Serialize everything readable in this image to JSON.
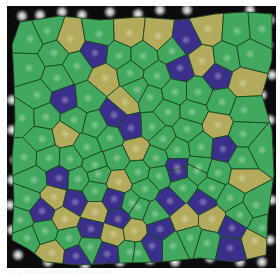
{
  "figure": {
    "type": "microscopy-voronoi-overlay",
    "frame": {
      "x": 7,
      "y": 6,
      "width": 269,
      "height": 262
    },
    "background_color": "#0c0a0c",
    "border_color": "#1c4a22",
    "colors": {
      "G": "#43a85f",
      "Y": "#b3ab5b",
      "B": "#3b2f8c"
    },
    "cells": [
      {
        "x": 30,
        "y": 39,
        "c": "G"
      },
      {
        "x": 47,
        "y": 31,
        "c": "G"
      },
      {
        "x": 70,
        "y": 39,
        "c": "Y"
      },
      {
        "x": 99,
        "y": 34,
        "c": "G"
      },
      {
        "x": 129,
        "y": 33,
        "c": "Y"
      },
      {
        "x": 95,
        "y": 53,
        "c": "B"
      },
      {
        "x": 119,
        "y": 56,
        "c": "G"
      },
      {
        "x": 29,
        "y": 68,
        "c": "G"
      },
      {
        "x": 54,
        "y": 53,
        "c": "G"
      },
      {
        "x": 57,
        "y": 78,
        "c": "G"
      },
      {
        "x": 77,
        "y": 66,
        "c": "G"
      },
      {
        "x": 105,
        "y": 78,
        "c": "Y"
      },
      {
        "x": 130,
        "y": 73,
        "c": "G"
      },
      {
        "x": 158,
        "y": 36,
        "c": "Y"
      },
      {
        "x": 186,
        "y": 40,
        "c": "B"
      },
      {
        "x": 208,
        "y": 29,
        "c": "Y"
      },
      {
        "x": 237,
        "y": 31,
        "c": "G"
      },
      {
        "x": 262,
        "y": 29,
        "c": "G"
      },
      {
        "x": 143,
        "y": 56,
        "c": "G"
      },
      {
        "x": 172,
        "y": 51,
        "c": "G"
      },
      {
        "x": 180,
        "y": 68,
        "c": "B"
      },
      {
        "x": 202,
        "y": 61,
        "c": "Y"
      },
      {
        "x": 227,
        "y": 58,
        "c": "G"
      },
      {
        "x": 250,
        "y": 54,
        "c": "G"
      },
      {
        "x": 218,
        "y": 76,
        "c": "B"
      },
      {
        "x": 243,
        "y": 83,
        "c": "Y"
      },
      {
        "x": 157,
        "y": 76,
        "c": "G"
      },
      {
        "x": 137,
        "y": 90,
        "c": "G"
      },
      {
        "x": 37,
        "y": 95,
        "c": "G"
      },
      {
        "x": 65,
        "y": 100,
        "c": "B"
      },
      {
        "x": 88,
        "y": 98,
        "c": "G"
      },
      {
        "x": 125,
        "y": 102,
        "c": "Y"
      },
      {
        "x": 22,
        "y": 118,
        "c": "G"
      },
      {
        "x": 46,
        "y": 117,
        "c": "G"
      },
      {
        "x": 74,
        "y": 120,
        "c": "G"
      },
      {
        "x": 114,
        "y": 115,
        "c": "B"
      },
      {
        "x": 131,
        "y": 128,
        "c": "B"
      },
      {
        "x": 95,
        "y": 125,
        "c": "G"
      },
      {
        "x": 65,
        "y": 134,
        "c": "Y"
      },
      {
        "x": 42,
        "y": 139,
        "c": "G"
      },
      {
        "x": 87,
        "y": 147,
        "c": "G"
      },
      {
        "x": 110,
        "y": 138,
        "c": "G"
      },
      {
        "x": 136,
        "y": 149,
        "c": "Y"
      },
      {
        "x": 24,
        "y": 157,
        "c": "G"
      },
      {
        "x": 49,
        "y": 158,
        "c": "G"
      },
      {
        "x": 70,
        "y": 159,
        "c": "G"
      },
      {
        "x": 117,
        "y": 158,
        "c": "G"
      },
      {
        "x": 95,
        "y": 165,
        "c": "G"
      },
      {
        "x": 150,
        "y": 97,
        "c": "G"
      },
      {
        "x": 175,
        "y": 92,
        "c": "G"
      },
      {
        "x": 198,
        "y": 92,
        "c": "G"
      },
      {
        "x": 222,
        "y": 102,
        "c": "G"
      },
      {
        "x": 168,
        "y": 112,
        "c": "G"
      },
      {
        "x": 192,
        "y": 112,
        "c": "G"
      },
      {
        "x": 218,
        "y": 125,
        "c": "Y"
      },
      {
        "x": 244,
        "y": 110,
        "c": "G"
      },
      {
        "x": 152,
        "y": 127,
        "c": "G"
      },
      {
        "x": 187,
        "y": 129,
        "c": "G"
      },
      {
        "x": 163,
        "y": 139,
        "c": "G"
      },
      {
        "x": 243,
        "y": 134,
        "c": "G"
      },
      {
        "x": 223,
        "y": 149,
        "c": "B"
      },
      {
        "x": 201,
        "y": 147,
        "c": "G"
      },
      {
        "x": 177,
        "y": 150,
        "c": "G"
      },
      {
        "x": 262,
        "y": 150,
        "c": "G"
      },
      {
        "x": 156,
        "y": 158,
        "c": "G"
      },
      {
        "x": 242,
        "y": 160,
        "c": "G"
      },
      {
        "x": 177,
        "y": 167,
        "c": "B"
      },
      {
        "x": 199,
        "y": 167,
        "c": "G"
      },
      {
        "x": 34,
        "y": 180,
        "c": "G"
      },
      {
        "x": 59,
        "y": 178,
        "c": "B"
      },
      {
        "x": 78,
        "y": 179,
        "c": "G"
      },
      {
        "x": 98,
        "y": 174,
        "c": "G"
      },
      {
        "x": 119,
        "y": 182,
        "c": "Y"
      },
      {
        "x": 27,
        "y": 199,
        "c": "G"
      },
      {
        "x": 54,
        "y": 197,
        "c": "Y"
      },
      {
        "x": 75,
        "y": 202,
        "c": "B"
      },
      {
        "x": 95,
        "y": 191,
        "c": "G"
      },
      {
        "x": 114,
        "y": 199,
        "c": "B"
      },
      {
        "x": 132,
        "y": 203,
        "c": "G"
      },
      {
        "x": 42,
        "y": 211,
        "c": "B"
      },
      {
        "x": 20,
        "y": 220,
        "c": "G"
      },
      {
        "x": 65,
        "y": 219,
        "c": "Y"
      },
      {
        "x": 95,
        "y": 212,
        "c": "Y"
      },
      {
        "x": 118,
        "y": 219,
        "c": "B"
      },
      {
        "x": 134,
        "y": 231,
        "c": "Y"
      },
      {
        "x": 27,
        "y": 238,
        "c": "G"
      },
      {
        "x": 45,
        "y": 231,
        "c": "G"
      },
      {
        "x": 91,
        "y": 229,
        "c": "B"
      },
      {
        "x": 113,
        "y": 234,
        "c": "Y"
      },
      {
        "x": 69,
        "y": 238,
        "c": "G"
      },
      {
        "x": 90,
        "y": 247,
        "c": "G"
      },
      {
        "x": 52,
        "y": 253,
        "c": "Y"
      },
      {
        "x": 76,
        "y": 256,
        "c": "B"
      },
      {
        "x": 107,
        "y": 254,
        "c": "B"
      },
      {
        "x": 130,
        "y": 252,
        "c": "G"
      },
      {
        "x": 138,
        "y": 172,
        "c": "G"
      },
      {
        "x": 159,
        "y": 176,
        "c": "G"
      },
      {
        "x": 178,
        "y": 171,
        "c": "B"
      },
      {
        "x": 197,
        "y": 171,
        "c": "G"
      },
      {
        "x": 218,
        "y": 173,
        "c": "G"
      },
      {
        "x": 242,
        "y": 178,
        "c": "Y"
      },
      {
        "x": 145,
        "y": 189,
        "c": "G"
      },
      {
        "x": 183,
        "y": 188,
        "c": "G"
      },
      {
        "x": 212,
        "y": 188,
        "c": "G"
      },
      {
        "x": 138,
        "y": 207,
        "c": "G"
      },
      {
        "x": 170,
        "y": 201,
        "c": "B"
      },
      {
        "x": 203,
        "y": 202,
        "c": "B"
      },
      {
        "x": 230,
        "y": 198,
        "c": "G"
      },
      {
        "x": 256,
        "y": 205,
        "c": "G"
      },
      {
        "x": 155,
        "y": 214,
        "c": "G"
      },
      {
        "x": 185,
        "y": 219,
        "c": "Y"
      },
      {
        "x": 212,
        "y": 219,
        "c": "Y"
      },
      {
        "x": 240,
        "y": 215,
        "c": "G"
      },
      {
        "x": 160,
        "y": 229,
        "c": "B"
      },
      {
        "x": 232,
        "y": 228,
        "c": "B"
      },
      {
        "x": 262,
        "y": 228,
        "c": "G"
      },
      {
        "x": 190,
        "y": 238,
        "c": "G"
      },
      {
        "x": 255,
        "y": 241,
        "c": "Y"
      },
      {
        "x": 152,
        "y": 246,
        "c": "B"
      },
      {
        "x": 173,
        "y": 246,
        "c": "G"
      },
      {
        "x": 207,
        "y": 243,
        "c": "G"
      },
      {
        "x": 230,
        "y": 248,
        "c": "B"
      },
      {
        "x": 138,
        "y": 253,
        "c": "G"
      }
    ],
    "hull": [
      [
        20,
        22
      ],
      [
        60,
        16
      ],
      [
        100,
        20
      ],
      [
        140,
        17
      ],
      [
        180,
        20
      ],
      [
        215,
        14
      ],
      [
        245,
        12
      ],
      [
        272,
        14
      ],
      [
        272,
        60
      ],
      [
        262,
        95
      ],
      [
        272,
        130
      ],
      [
        274,
        175
      ],
      [
        268,
        215
      ],
      [
        266,
        255
      ],
      [
        235,
        262
      ],
      [
        200,
        258
      ],
      [
        160,
        262
      ],
      [
        120,
        263
      ],
      [
        80,
        265
      ],
      [
        45,
        262
      ],
      [
        30,
        250
      ],
      [
        12,
        240
      ],
      [
        14,
        200
      ],
      [
        12,
        160
      ],
      [
        15,
        120
      ],
      [
        14,
        80
      ],
      [
        12,
        45
      ]
    ],
    "bright_spots": [
      [
        22,
        16
      ],
      [
        40,
        15
      ],
      [
        62,
        12
      ],
      [
        82,
        15
      ],
      [
        110,
        12
      ],
      [
        138,
        14
      ],
      [
        160,
        10
      ],
      [
        187,
        10
      ],
      [
        250,
        10
      ],
      [
        270,
        20
      ],
      [
        268,
        45
      ],
      [
        272,
        75
      ],
      [
        262,
        95
      ],
      [
        270,
        120
      ],
      [
        268,
        150
      ],
      [
        266,
        175
      ],
      [
        272,
        200
      ],
      [
        270,
        240
      ],
      [
        12,
        100
      ],
      [
        12,
        130
      ],
      [
        15,
        160
      ],
      [
        12,
        180
      ],
      [
        10,
        205
      ],
      [
        12,
        230
      ],
      [
        18,
        255
      ],
      [
        48,
        262
      ],
      [
        85,
        265
      ],
      [
        120,
        262
      ],
      [
        150,
        260
      ],
      [
        175,
        262
      ],
      [
        210,
        258
      ],
      [
        240,
        262
      ],
      [
        262,
        262
      ]
    ],
    "caption": "Fig. 1 Voronoi tessellation of surface sites"
  }
}
